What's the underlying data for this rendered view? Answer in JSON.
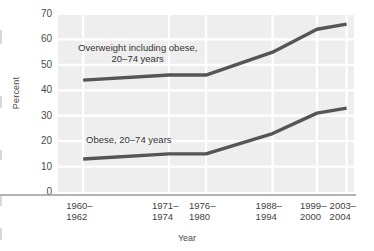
{
  "chart_data": {
    "type": "line",
    "title": "",
    "xlabel": "Year",
    "ylabel": "Percent",
    "ylim": [
      0,
      70
    ],
    "ytick_values": [
      70,
      60,
      50,
      40,
      30,
      20,
      10,
      0
    ],
    "ytick_labels": [
      "70",
      "60",
      "50",
      "40",
      "30",
      "20",
      "10",
      "0"
    ],
    "grid": true,
    "legend_position": "inline-annotation",
    "categories": [
      "1960–1962",
      "1971–1974",
      "1976–1980",
      "1988–1994",
      "1999–2000",
      "2003–2004"
    ],
    "category_positions": [
      0.085,
      0.375,
      0.5,
      0.725,
      0.875,
      0.975
    ],
    "series": [
      {
        "name": "Overweight including obese, 20–74 years",
        "color": "#555555",
        "values": [
          44,
          46,
          46,
          55,
          64,
          66
        ]
      },
      {
        "name": "Obese, 20–74 years",
        "color": "#555555",
        "values": [
          13,
          15,
          15,
          23,
          31,
          33
        ]
      }
    ],
    "annotations": [
      {
        "name": "overweight-series-label",
        "text": "Overweight including obese,\n20–74 years",
        "x_px": 78,
        "y_px": 42
      },
      {
        "name": "obese-series-label",
        "text": "Obese, 20–74 years",
        "x_px": 86,
        "y_px": 134
      }
    ],
    "colors": {
      "plot_background": "#eeeeee",
      "gridline": "#ffffff",
      "line": "#555555",
      "axis": "#9a9a9a",
      "text": "#3f3f3f"
    }
  },
  "axis": {
    "x_title": "Year",
    "y_title": "Percent"
  }
}
